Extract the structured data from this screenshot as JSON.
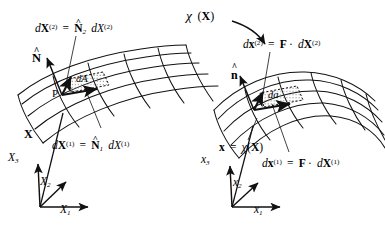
{
  "figure": {
    "map_label": "χ (X)",
    "domain_type": "diagram"
  },
  "reference_config": {
    "point_label": "P",
    "normal_label": "N",
    "area_label": "dA",
    "position_vector": "X",
    "eq_dX2": {
      "lhs": "dX",
      "lhs_sup": "(2)",
      "eq": "=",
      "rhs_vec": "N",
      "rhs_sub": "2",
      "rhs_tail": "dX",
      "rhs_tail_sup": "(2)"
    },
    "eq_dX1": {
      "lhs": "dX",
      "lhs_sup": "(1)",
      "eq": "=",
      "rhs_vec": "N",
      "rhs_sub": "1",
      "rhs_tail": "dX",
      "rhs_tail_sup": "(1)"
    },
    "axes": [
      {
        "name": "axis-X1",
        "label": "X",
        "sub": "1"
      },
      {
        "name": "axis-X2",
        "label": "X",
        "sub": "2"
      },
      {
        "name": "axis-X3",
        "label": "X",
        "sub": "3"
      }
    ]
  },
  "current_config": {
    "normal_label": "n",
    "area_label": "da",
    "position_eq": {
      "lhs": "x",
      "eq": "=",
      "chi": "χ",
      "arg": "(X)"
    },
    "eq_dx2": {
      "lhs": "dx",
      "lhs_sup": "(2)",
      "eq": "=",
      "F": "F",
      "dot": "·",
      "rhs": "dX",
      "rhs_sup": "(2)"
    },
    "eq_dx1": {
      "lhs": "dx",
      "lhs_sup": "(1)",
      "eq": "=",
      "F": "F",
      "dot": "·",
      "rhs": "dX",
      "rhs_sup": "(1)"
    },
    "axes": [
      {
        "name": "axis-x1",
        "label": "x",
        "sub": "1"
      },
      {
        "name": "axis-x2",
        "label": "x",
        "sub": "2"
      },
      {
        "name": "axis-x3",
        "label": "x",
        "sub": "3"
      }
    ]
  },
  "colors": {
    "ink": "#111111",
    "background": "#ffffff",
    "stipple": "#7a7a7a"
  }
}
